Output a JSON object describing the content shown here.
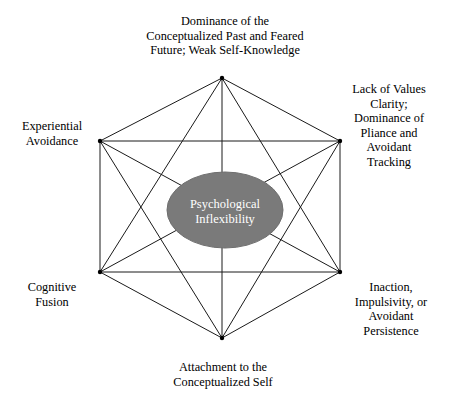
{
  "diagram": {
    "core": {
      "line1": "Psychological",
      "line2": "Inflexibility",
      "fill_color": "#7a7a7a",
      "text_color": "#ffffff"
    },
    "line_color": "#1a1a1a",
    "background_color": "#ffffff",
    "nodes": [
      {
        "id": "top",
        "label": "Dominance of the\nConceptualized Past and Feared\nFuture; Weak Self-Knowledge",
        "vertex": {
          "x": 222,
          "y": 78
        }
      },
      {
        "id": "upper-right",
        "label": "Lack of Values\nClarity;\nDominance of\nPliance and\nAvoidant\nTracking",
        "vertex": {
          "x": 340,
          "y": 141
        }
      },
      {
        "id": "lower-right",
        "label": "Inaction,\nImpulsivity, or\nAvoidant\nPersistence",
        "vertex": {
          "x": 340,
          "y": 272
        }
      },
      {
        "id": "bottom",
        "label": "Attachment to the\nConceptualized Self",
        "vertex": {
          "x": 222,
          "y": 338
        }
      },
      {
        "id": "lower-left",
        "label": "Cognitive\nFusion",
        "vertex": {
          "x": 100,
          "y": 272
        }
      },
      {
        "id": "upper-left",
        "label": "Experiential\nAvoidance",
        "vertex": {
          "x": 100,
          "y": 141
        }
      }
    ],
    "edges": [
      [
        0,
        1
      ],
      [
        0,
        2
      ],
      [
        0,
        3
      ],
      [
        0,
        4
      ],
      [
        0,
        5
      ],
      [
        1,
        2
      ],
      [
        1,
        3
      ],
      [
        1,
        4
      ],
      [
        1,
        5
      ],
      [
        2,
        3
      ],
      [
        2,
        4
      ],
      [
        2,
        5
      ],
      [
        3,
        4
      ],
      [
        3,
        5
      ],
      [
        4,
        5
      ]
    ],
    "ellipse": {
      "cx": 225,
      "cy": 210,
      "rx": 58,
      "ry": 38
    }
  }
}
